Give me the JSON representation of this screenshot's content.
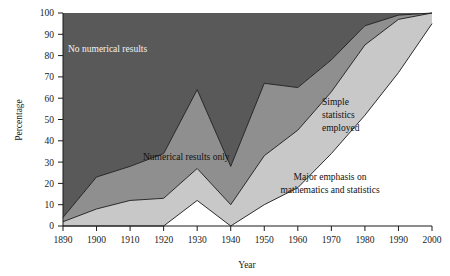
{
  "chart_data": {
    "type": "area",
    "subtype": "stacked-area-100",
    "title": "",
    "xlabel": "Year",
    "ylabel": "Percentage",
    "xlim": [
      1890,
      2000
    ],
    "ylim": [
      0,
      100
    ],
    "grid": false,
    "legend_position": "inline-annotations",
    "x": [
      1890,
      1900,
      1910,
      1920,
      1930,
      1940,
      1950,
      1960,
      1970,
      1980,
      1990,
      2000
    ],
    "xtick_labels": [
      "1890",
      "1900",
      "1910",
      "1920",
      "1930",
      "1940",
      "1950",
      "1960",
      "1970",
      "1980",
      "1990",
      "2000"
    ],
    "ytick_labels": [
      "0",
      "10",
      "20",
      "30",
      "40",
      "50",
      "60",
      "70",
      "80",
      "90",
      "100"
    ],
    "ytick_values": [
      0,
      10,
      20,
      30,
      40,
      50,
      60,
      70,
      80,
      90,
      100
    ],
    "series": [
      {
        "name": "Major emphasis on mathematics and statistics",
        "color": "#ffffff",
        "values": [
          0,
          0,
          0,
          0,
          12,
          0,
          10,
          18,
          34,
          52,
          72,
          95
        ]
      },
      {
        "name": "Simple statistics employed",
        "color": "#c8c8c8",
        "values": [
          2,
          8,
          12,
          13,
          15,
          10,
          23,
          27,
          29,
          33,
          25,
          5
        ]
      },
      {
        "name": "Numerical results only",
        "color": "#8f8f8f",
        "values": [
          2,
          15,
          16,
          21,
          37,
          18,
          34,
          20,
          15,
          9,
          2,
          0
        ]
      },
      {
        "name": "No numerical results",
        "color": "#595959",
        "values": [
          96,
          77,
          72,
          66,
          36,
          72,
          33,
          35,
          22,
          6,
          1,
          0
        ]
      }
    ],
    "cumulative_boundaries": {
      "note": "Upper edge of each stacked band, percentage, at each x",
      "boundary_1_top_of_white": [
        0,
        0,
        0,
        0,
        12,
        0,
        10,
        18,
        34,
        52,
        72,
        95
      ],
      "boundary_2_top_of_light": [
        2,
        8,
        12,
        13,
        27,
        10,
        33,
        45,
        63,
        85,
        97,
        100
      ],
      "boundary_3_top_of_medium": [
        4,
        23,
        28,
        34,
        64,
        28,
        67,
        65,
        78,
        94,
        99,
        100
      ],
      "boundary_4_top": [
        100,
        100,
        100,
        100,
        100,
        100,
        100,
        100,
        100,
        100,
        100,
        100
      ]
    },
    "annotations": [
      {
        "id": "no-numerical-results",
        "text": "No numerical results",
        "x": 1900,
        "y": 82,
        "color": "#f2f2f2"
      },
      {
        "id": "numerical-results-only",
        "text": "Numerical results only",
        "x": 1918,
        "y": 34,
        "color": "#111111"
      },
      {
        "id": "simple-statistics-employed",
        "text": "Simple\nstatistics\nemployed",
        "x": 1963,
        "y": 55,
        "color": "#111111"
      },
      {
        "id": "major-emphasis",
        "text": "Major emphasis on\nmathematics and statistics",
        "x": 1975,
        "y": 20,
        "color": "#111111"
      }
    ]
  },
  "labels": {
    "y_axis_title": "Percentage",
    "x_axis_title": "Year",
    "band_no_numerical": "No numerical results",
    "band_numerical_only": "Numerical results only",
    "band_simple_statistics_line1": "Simple",
    "band_simple_statistics_line2": "statistics",
    "band_simple_statistics_line3": "employed",
    "band_major_emphasis_line1": "Major emphasis on",
    "band_major_emphasis_line2": "mathematics and statistics"
  },
  "ticks": {
    "y": [
      "100",
      "90",
      "80",
      "70",
      "60",
      "50",
      "40",
      "30",
      "20",
      "10",
      "0"
    ],
    "x": [
      "1890",
      "1900",
      "1910",
      "1920",
      "1930",
      "1940",
      "1950",
      "1960",
      "1970",
      "1980",
      "1990",
      "2000"
    ]
  },
  "colors": {
    "band_dark": "#595959",
    "band_medium": "#8f8f8f",
    "band_light": "#c8c8c8",
    "band_white": "#ffffff",
    "axis": "#1a1a1a",
    "boundary_line": "#1a1a1a",
    "text_dark": "#111111",
    "text_light": "#f2f2f2",
    "background": "#ffffff"
  }
}
